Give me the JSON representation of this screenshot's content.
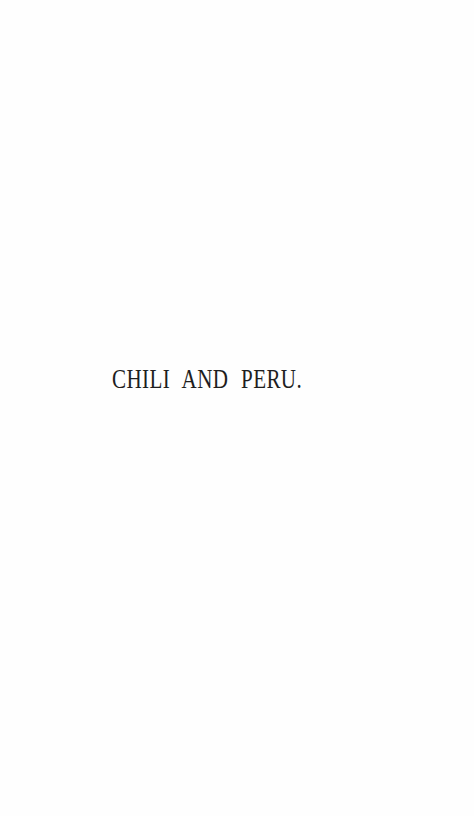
{
  "page": {
    "title": "CHILI AND PERU."
  }
}
